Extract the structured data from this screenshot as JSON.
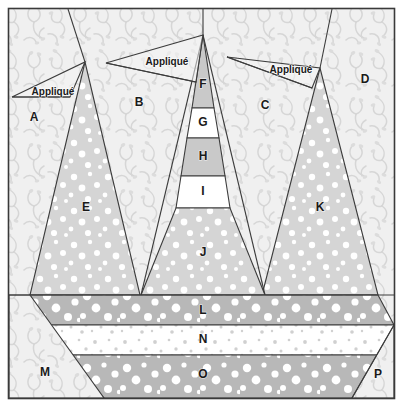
{
  "diagram": {
    "type": "quilt-block-piecing-diagram",
    "width": 403,
    "height": 407,
    "frame": {
      "x": 8,
      "y": 8,
      "width": 387,
      "height": 391,
      "border_color": "#3a3a3a"
    }
  },
  "palette": {
    "page_background": "#ffffff",
    "background_print": "#f0f0f0",
    "background_print_motif": "#d8d8d8",
    "tree_light_dot": "#d5d5d5",
    "tree_light_dot_spots": "#ffffff",
    "tree_mid_gray": "#c9c9c9",
    "tree_solid_white": "#ffffff",
    "strip_mid_gray": "#b8b8b8",
    "strip_white_dot": "#ffffff",
    "strip_white_dot_spots": "#d0d0d0",
    "outline": "#3c3c3c",
    "label_text": "#1a1a1a"
  },
  "pieces": [
    {
      "id": "A",
      "label": "A",
      "fabric": "background-print",
      "label_x": 34,
      "label_y": 118
    },
    {
      "id": "B",
      "label": "B",
      "fabric": "background-print",
      "label_x": 139,
      "label_y": 103
    },
    {
      "id": "C",
      "label": "C",
      "fabric": "background-print",
      "label_x": 265,
      "label_y": 106
    },
    {
      "id": "D",
      "label": "D",
      "fabric": "background-print",
      "label_x": 365,
      "label_y": 80
    },
    {
      "id": "E",
      "label": "E",
      "fabric": "light-dot",
      "label_x": 86,
      "label_y": 208
    },
    {
      "id": "F",
      "label": "F",
      "fabric": "mid-gray",
      "label_x": 203,
      "label_y": 85
    },
    {
      "id": "G",
      "label": "G",
      "fabric": "solid-white",
      "label_x": 203,
      "label_y": 123
    },
    {
      "id": "H",
      "label": "H",
      "fabric": "mid-gray",
      "label_x": 203,
      "label_y": 157
    },
    {
      "id": "I",
      "label": "I",
      "fabric": "solid-white",
      "label_x": 203,
      "label_y": 192
    },
    {
      "id": "J",
      "label": "J",
      "fabric": "light-dot",
      "label_x": 203,
      "label_y": 253
    },
    {
      "id": "K",
      "label": "K",
      "fabric": "light-dot",
      "label_x": 320,
      "label_y": 208
    },
    {
      "id": "L",
      "label": "L",
      "fabric": "strip-mid-gray",
      "label_x": 203,
      "label_y": 311
    },
    {
      "id": "M",
      "label": "M",
      "fabric": "background-print",
      "label_x": 45,
      "label_y": 373
    },
    {
      "id": "N",
      "label": "N",
      "fabric": "strip-white-dot",
      "label_x": 203,
      "label_y": 340
    },
    {
      "id": "O",
      "label": "O",
      "fabric": "strip-mid-gray",
      "label_x": 203,
      "label_y": 375
    },
    {
      "id": "P",
      "label": "P",
      "fabric": "background-print",
      "label_x": 378,
      "label_y": 375
    }
  ],
  "appliques": [
    {
      "id": "applique-left",
      "label": "Appliqué",
      "label_x": 53,
      "label_y": 92
    },
    {
      "id": "applique-center",
      "label": "Appliqué",
      "label_x": 167,
      "label_y": 62
    },
    {
      "id": "applique-right",
      "label": "Appliqué",
      "label_x": 291,
      "label_y": 70
    }
  ]
}
